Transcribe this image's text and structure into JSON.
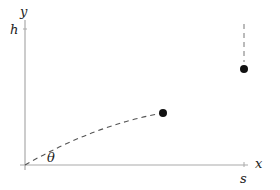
{
  "diagram": {
    "axes": {
      "x_label": "x",
      "y_label": "y",
      "color": "#aaaaaa"
    },
    "ticks": {
      "h_label": "h",
      "s_label": "s"
    },
    "angle_label": "θ",
    "curve": {
      "style": "dashed",
      "color": "#555555"
    },
    "points": [
      {
        "name": "apex",
        "color": "#111111"
      },
      {
        "name": "landing",
        "color": "#111111"
      }
    ],
    "vertical_drop": {
      "style": "dashed",
      "color": "#777777"
    }
  }
}
